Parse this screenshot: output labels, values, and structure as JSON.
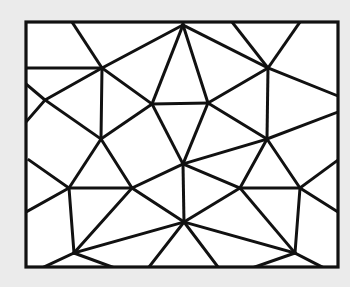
{
  "figure": {
    "background_color": "#ebebeb",
    "paper_color": "#ffffff",
    "stroke_color": "#111111",
    "canvas": {
      "width": 350,
      "height": 287
    },
    "frame": {
      "name": "outer-rectangle-border",
      "x": 26,
      "y": 22,
      "width": 312,
      "height": 245,
      "stroke_width": 3.2
    },
    "line_stroke_width": 3.0,
    "vertices": [
      {
        "id": "v-tl-pin",
        "x": 102,
        "y": 68
      },
      {
        "id": "v-tm-pin",
        "x": 268,
        "y": 68
      },
      {
        "id": "v-ml-pin",
        "x": 101,
        "y": 139
      },
      {
        "id": "v-mr-pin",
        "x": 267,
        "y": 139
      },
      {
        "id": "v-center-pin",
        "x": 183,
        "y": 164
      },
      {
        "id": "v-top-apex",
        "x": 183,
        "y": 25
      },
      {
        "id": "v-left-edge-a",
        "x": 45,
        "y": 100
      },
      {
        "id": "v-left-edge-b",
        "x": 29,
        "y": 175
      },
      {
        "id": "v-bar-tl",
        "x": 152,
        "y": 104
      },
      {
        "id": "v-bar-tr",
        "x": 208,
        "y": 103
      },
      {
        "id": "v-bar-bl",
        "x": 69,
        "y": 188
      },
      {
        "id": "v-bar-br",
        "x": 132,
        "y": 188
      },
      {
        "id": "v-bar-br2l",
        "x": 240,
        "y": 188
      },
      {
        "id": "v-bar-br2r",
        "x": 300,
        "y": 188
      },
      {
        "id": "v-bottom-pin",
        "x": 184,
        "y": 222
      },
      {
        "id": "v-bl-pin",
        "x": 74,
        "y": 253
      },
      {
        "id": "v-br-pin",
        "x": 295,
        "y": 253
      }
    ],
    "segments": [
      [
        26,
        68,
        102,
        68
      ],
      [
        102,
        68,
        183,
        25
      ],
      [
        102,
        68,
        72,
        22
      ],
      [
        102,
        68,
        152,
        104
      ],
      [
        102,
        68,
        101,
        139
      ],
      [
        102,
        68,
        45,
        100
      ],
      [
        45,
        100,
        26,
        84
      ],
      [
        45,
        100,
        26,
        122
      ],
      [
        45,
        100,
        101,
        139
      ],
      [
        101,
        139,
        152,
        104
      ],
      [
        101,
        139,
        132,
        188
      ],
      [
        101,
        139,
        69,
        188
      ],
      [
        69,
        188,
        132,
        188
      ],
      [
        69,
        188,
        29,
        160
      ],
      [
        69,
        188,
        74,
        253
      ],
      [
        69,
        188,
        26,
        212
      ],
      [
        132,
        188,
        183,
        164
      ],
      [
        132,
        188,
        184,
        222
      ],
      [
        132,
        188,
        74,
        253
      ],
      [
        74,
        253,
        112,
        267
      ],
      [
        74,
        253,
        44,
        267
      ],
      [
        74,
        253,
        184,
        222
      ],
      [
        152,
        104,
        208,
        103
      ],
      [
        152,
        104,
        183,
        164
      ],
      [
        183,
        25,
        208,
        103
      ],
      [
        183,
        25,
        152,
        104
      ],
      [
        183,
        25,
        183,
        22
      ],
      [
        208,
        103,
        183,
        164
      ],
      [
        208,
        103,
        268,
        68
      ],
      [
        268,
        68,
        183,
        25
      ],
      [
        268,
        68,
        232,
        22
      ],
      [
        268,
        68,
        300,
        22
      ],
      [
        268,
        68,
        338,
        96
      ],
      [
        268,
        68,
        267,
        139
      ],
      [
        267,
        139,
        208,
        103
      ],
      [
        267,
        139,
        183,
        164
      ],
      [
        267,
        139,
        338,
        112
      ],
      [
        267,
        139,
        240,
        188
      ],
      [
        267,
        139,
        300,
        188
      ],
      [
        240,
        188,
        300,
        188
      ],
      [
        240,
        188,
        183,
        164
      ],
      [
        240,
        188,
        184,
        222
      ],
      [
        240,
        188,
        295,
        253
      ],
      [
        300,
        188,
        338,
        160
      ],
      [
        300,
        188,
        338,
        212
      ],
      [
        300,
        188,
        295,
        253
      ],
      [
        295,
        253,
        184,
        222
      ],
      [
        295,
        253,
        255,
        267
      ],
      [
        295,
        253,
        322,
        267
      ],
      [
        183,
        164,
        184,
        222
      ],
      [
        184,
        222,
        149,
        267
      ],
      [
        184,
        222,
        218,
        267
      ]
    ]
  }
}
